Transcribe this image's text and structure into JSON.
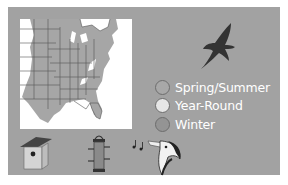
{
  "legend": {
    "items": [
      {
        "label": "Spring/Summer",
        "color": "#a8a8a8"
      },
      {
        "label": "Year-Round",
        "color": "#e6e6e6"
      },
      {
        "label": "Winter",
        "color": "#949494"
      }
    ]
  },
  "icons": {
    "bird_silhouette": "flying-bird-silhouette",
    "nest_box": "birdhouse",
    "feeder": "tube-feeder",
    "song": "singing-bird-head"
  },
  "colors": {
    "panel": "#a2a2a2",
    "map_land": "#a6a6a6",
    "map_background": "#ffffff",
    "outline": "#555555",
    "label_text": "#ffffff"
  }
}
